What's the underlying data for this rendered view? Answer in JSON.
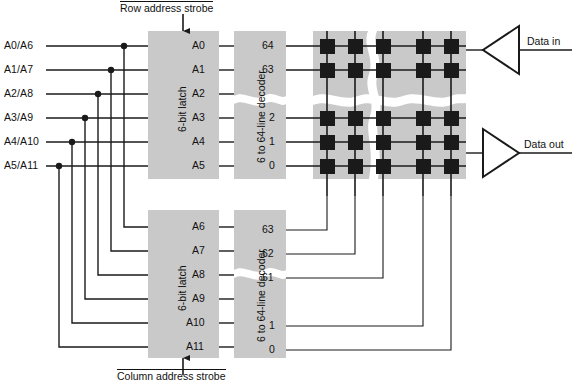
{
  "diagram": {
    "colors": {
      "block_fill": "#c9c9c9",
      "line": "#1a1a1a",
      "cell": "#1a1a1a",
      "background": "#ffffff",
      "break_line": "#ffffff"
    },
    "address_bus": {
      "name": "multiplexed-address-lines",
      "lines": [
        {
          "label": "A0/A6",
          "y": 46
        },
        {
          "label": "A1/A7",
          "y": 70
        },
        {
          "label": "A2/A8",
          "y": 94
        },
        {
          "label": "A3/A9",
          "y": 118
        },
        {
          "label": "A4/A10",
          "y": 142
        },
        {
          "label": "A5/A11",
          "y": 166
        }
      ]
    },
    "row_latch": {
      "name": "row-address-latch",
      "label": "6-bit latch",
      "pins": [
        "A0",
        "A1",
        "A2",
        "A3",
        "A4",
        "A5"
      ],
      "strobe": "Row address strobe"
    },
    "column_latch": {
      "name": "column-address-latch",
      "label": "6-bit latch",
      "pins": [
        "A6",
        "A7",
        "A8",
        "A9",
        "A10",
        "A11"
      ],
      "strobe": "Column address strobe"
    },
    "row_decoder": {
      "name": "row-decoder",
      "label": "6 to 64-line decoder",
      "outputs": [
        "64",
        "63",
        "2",
        "1",
        "0"
      ]
    },
    "column_decoder": {
      "name": "column-decoder",
      "label": "6 to 64-line decoder",
      "outputs": [
        "63",
        "62",
        "61",
        "1",
        "0"
      ]
    },
    "memory_array": {
      "name": "memory-cell-array",
      "rows": 5,
      "cols": 5,
      "cell_label": "memory-cell"
    },
    "data_in": {
      "name": "data-in-buffer",
      "label": "Data in",
      "direction": "left"
    },
    "data_out": {
      "name": "data-out-buffer",
      "label": "Data out",
      "direction": "right"
    }
  }
}
